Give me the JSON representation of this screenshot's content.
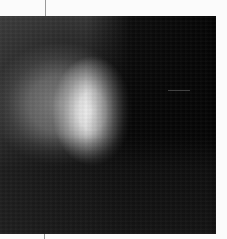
{
  "image": {
    "description": "Grayscale blurred bright blob on dark background",
    "colors": {
      "frame": "#fbfbfb",
      "background_dark": "#111111",
      "blob_core": "#f5f5f5",
      "blob_halo": "#828282",
      "tick": "#9a9a9a"
    }
  }
}
